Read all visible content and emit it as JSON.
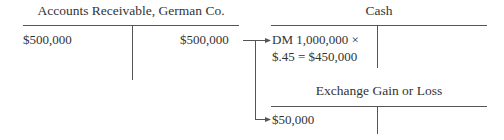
{
  "accounts": [
    {
      "title": "Accounts Receivable, German Co.",
      "debit": "$500,000",
      "credit": "$500,000"
    },
    {
      "title": "Cash",
      "debit_line1": "DM 1,000,000 ×",
      "debit_line2": "$.45 = $450,000",
      "credit": ""
    },
    {
      "title": "Exchange Gain or Loss",
      "debit": "$50,000",
      "credit": ""
    }
  ]
}
